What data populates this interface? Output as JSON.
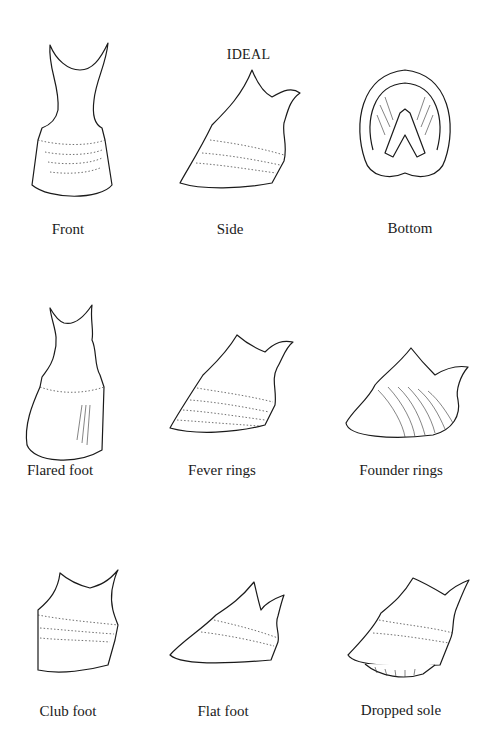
{
  "figure": {
    "title": "IDEAL",
    "rows": [
      {
        "items": [
          {
            "label": "Front",
            "view": "front"
          },
          {
            "label": "Side",
            "view": "side"
          },
          {
            "label": "Bottom",
            "view": "bottom"
          }
        ]
      },
      {
        "items": [
          {
            "label": "Flared foot",
            "view": "front-flared"
          },
          {
            "label": "Fever rings",
            "view": "side-rings"
          },
          {
            "label": "Founder rings",
            "view": "side-founder"
          }
        ]
      },
      {
        "items": [
          {
            "label": "Club foot",
            "view": "side-club"
          },
          {
            "label": "Flat foot",
            "view": "side-flat"
          },
          {
            "label": "Dropped sole",
            "view": "side-dropped"
          }
        ]
      }
    ]
  }
}
